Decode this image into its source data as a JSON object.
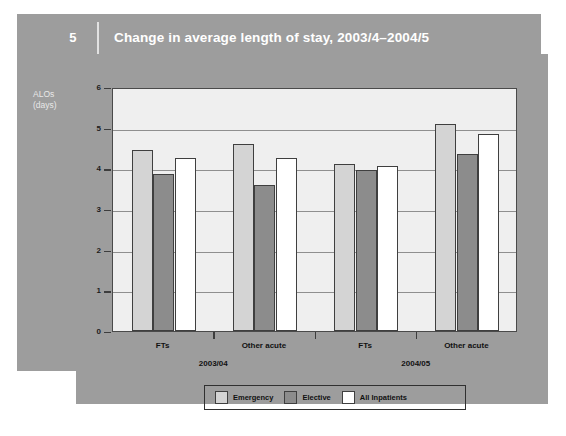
{
  "header": {
    "figure_number": "5",
    "title": "Change in average length of stay, 2003/4–2004/5"
  },
  "axis": {
    "y_caption_line1": "ALOs",
    "y_caption_line2": "(days)"
  },
  "legend": {
    "items": [
      {
        "label": "Emergency",
        "color": "#d4d4d4",
        "key": "emergency"
      },
      {
        "label": "Elective",
        "color": "#8c8c8c",
        "key": "elective"
      },
      {
        "label": "All Inpatients",
        "color": "#ffffff",
        "key": "all"
      }
    ]
  },
  "chart_data": {
    "type": "bar",
    "title": "Change in average length of stay, 2003/4–2004/5",
    "xlabel": "",
    "ylabel": "ALOs (days)",
    "ylim": [
      0,
      6
    ],
    "yticks": [
      0,
      1,
      2,
      3,
      4,
      5,
      6
    ],
    "ytick_labels": [
      "0",
      "1",
      "2",
      "3",
      "4",
      "5",
      "6"
    ],
    "grid": true,
    "legend_position": "bottom",
    "categories": [
      "FTs",
      "Other acute",
      "FTs",
      "Other acute"
    ],
    "group_labels": [
      "2003/04",
      "2004/05"
    ],
    "groups": [
      {
        "year": "2003/04",
        "category": "FTs"
      },
      {
        "year": "2003/04",
        "category": "Other acute"
      },
      {
        "year": "2004/05",
        "category": "FTs"
      },
      {
        "year": "2004/05",
        "category": "Other acute"
      }
    ],
    "series": [
      {
        "name": "Emergency",
        "color": "#d4d4d4",
        "values": [
          4.45,
          4.6,
          4.1,
          5.1
        ]
      },
      {
        "name": "Elective",
        "color": "#8c8c8c",
        "values": [
          3.85,
          3.6,
          3.95,
          4.35
        ]
      },
      {
        "name": "All Inpatients",
        "color": "#ffffff",
        "values": [
          4.25,
          4.25,
          4.05,
          4.85
        ]
      }
    ]
  }
}
